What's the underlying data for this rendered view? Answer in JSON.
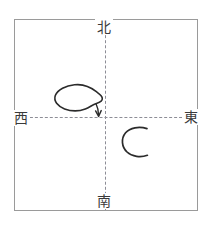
{
  "diagram": {
    "frame": {
      "border_color": "#9a9a9a",
      "background": "#ffffff"
    },
    "axes": {
      "style": "dashed",
      "color": "#8d8d96",
      "horizontal_label_left": "西",
      "horizontal_label_right": "東",
      "vertical_label_top": "北",
      "vertical_label_bottom": "南"
    },
    "direction_labels": [
      {
        "name": "north",
        "text": "北",
        "position": "top-center"
      },
      {
        "name": "east",
        "text": "東",
        "position": "right-middle"
      },
      {
        "name": "south",
        "text": "南",
        "position": "bottom-center"
      },
      {
        "name": "west",
        "text": "西",
        "position": "left-middle"
      }
    ],
    "annotations": [
      {
        "name": "blob-loop",
        "shape": "closed-bean-loop",
        "quadrant": "northwest",
        "stroke_color": "#2b2b2b",
        "description": "hand-drawn closed bean shaped loop in the upper-left quadrant"
      },
      {
        "name": "blob-arrow",
        "shape": "arrow-down",
        "quadrant": "northwest",
        "stroke_color": "#2b2b2b",
        "description": "short arrow descending from the loop toward the axis origin"
      },
      {
        "name": "c-curve",
        "shape": "open-c-arc",
        "quadrant": "southeast",
        "stroke_color": "#2b2b2b",
        "description": "hand-drawn C shaped open arc in the lower-right quadrant"
      }
    ]
  }
}
